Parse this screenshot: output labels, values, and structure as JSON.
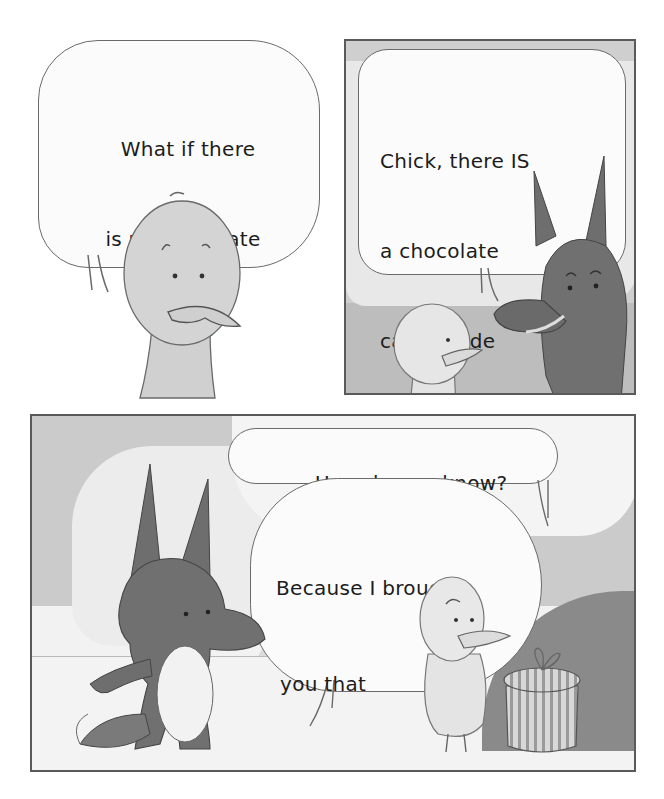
{
  "comic": {
    "panels": [
      {
        "id": "panel-1",
        "speaker": "Chick",
        "speech": [
          "What if there",
          "is no chocolate",
          "cake?"
        ]
      },
      {
        "id": "panel-2",
        "speaker": "Fox",
        "speech": [
          "Chick, there IS",
          "a chocolate",
          "cake inside",
          "that box."
        ]
      },
      {
        "id": "panel-3",
        "dialogue": [
          {
            "speaker": "Chick",
            "lines": [
              "How do you know?"
            ]
          },
          {
            "speaker": "Fox",
            "lines": [
              "Because I brought",
              "you that",
              "box."
            ]
          }
        ]
      }
    ],
    "colors": {
      "fox": "#6e6e6e",
      "chick": "#d2d2d2",
      "sky": "#c8c8c8",
      "ground": "#ececec",
      "outline": "#5a5a5a"
    }
  }
}
